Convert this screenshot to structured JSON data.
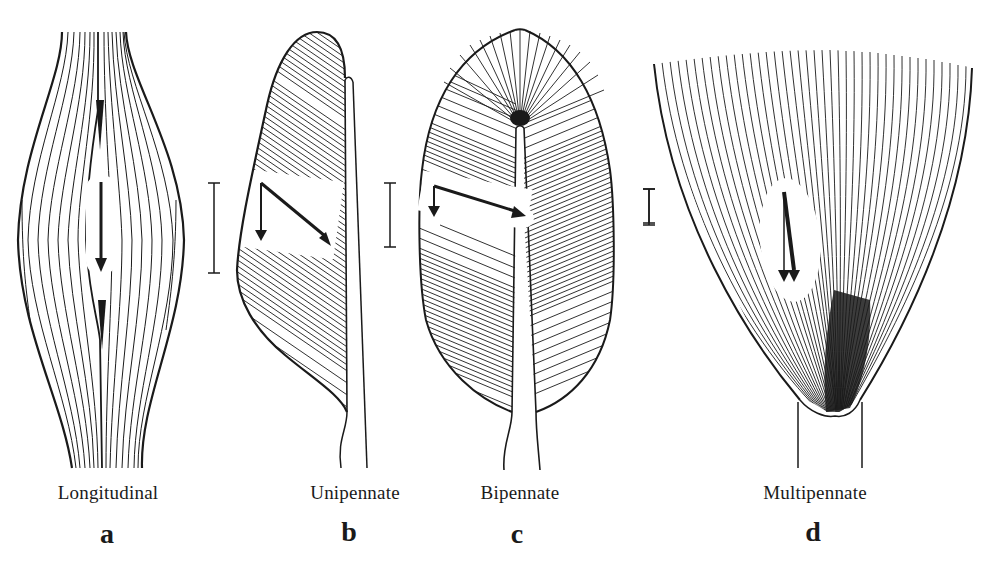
{
  "figures": [
    {
      "id": "a",
      "letter": "a",
      "label": "Longitudinal"
    },
    {
      "id": "b",
      "letter": "b",
      "label": "Unipennate"
    },
    {
      "id": "c",
      "letter": "c",
      "label": "Bipennate"
    },
    {
      "id": "d",
      "letter": "d",
      "label": "Multipennate"
    }
  ],
  "colors": {
    "ink": "#1a1a1a",
    "paper": "#ffffff"
  }
}
